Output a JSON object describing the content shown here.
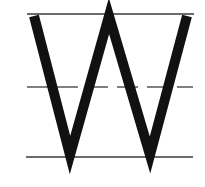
{
  "worksheet": {
    "letter": "W",
    "background": "#ffffff",
    "guide_lines": {
      "top": {
        "y": 14,
        "x1": 27,
        "x2": 194,
        "color": "#3a3a3a",
        "width": 1.6,
        "style": "solid"
      },
      "middle": {
        "y": 87,
        "x1": 27,
        "x2": 193,
        "color": "#555555",
        "width": 1.4,
        "style": "dashed",
        "dash": "21 9"
      },
      "bottom": {
        "y": 157,
        "x1": 26,
        "x2": 193,
        "color": "#3a3a3a",
        "width": 1.6,
        "style": "solid"
      }
    },
    "glyph": {
      "color": "#111111",
      "stroke_width": 10,
      "points": [
        [
          34,
          16
        ],
        [
          70,
          155
        ],
        [
          109,
          16
        ],
        [
          150,
          155
        ],
        [
          187,
          16
        ]
      ]
    }
  }
}
